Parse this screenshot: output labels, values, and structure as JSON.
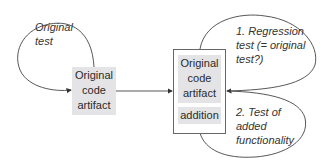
{
  "diagram": {
    "left_loop_label": [
      "Original",
      "test"
    ],
    "left_box": [
      "Original",
      "code",
      "artifact"
    ],
    "right_box": {
      "original": [
        "Original",
        "code",
        "artifact"
      ],
      "addition": "addition"
    },
    "top_loop_label": [
      "1. Regression",
      "test (= original",
      "test?)"
    ],
    "bottom_loop_label": [
      "2. Test of",
      "added",
      "functionality"
    ]
  },
  "colors": {
    "shade": "#e4e4e6",
    "line": "#444444"
  }
}
